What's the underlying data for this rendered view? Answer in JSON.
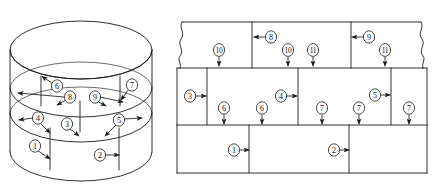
{
  "figure": {
    "type": "technical-line-drawing",
    "background_color": "#ffffff",
    "line_color": "#1a1a1a",
    "views": [
      {
        "id": "cylinder-view",
        "name": "perspective-cylinder-view",
        "callouts": [
          {
            "id": "c1",
            "label": "1",
            "cx": 35,
            "cy": 146,
            "arrow_to": [
              50,
              159
            ],
            "band": "lower"
          },
          {
            "id": "c2",
            "label": "2",
            "cx": 100,
            "cy": 155,
            "arrow_to": [
              119,
              155
            ],
            "band": "lower"
          },
          {
            "id": "c3",
            "label": "3",
            "cx": 67,
            "cy": 124,
            "arrow_to": [
              80,
              136
            ],
            "band": "middle"
          },
          {
            "id": "c4",
            "label": "4",
            "cx": 38,
            "cy": 119,
            "arrow_to": [
              18,
              120
            ],
            "band": "middle"
          },
          {
            "id": "c5",
            "label": "5",
            "cx": 119,
            "cy": 121,
            "arrow_to": [
              142,
              119
            ],
            "band": "middle"
          },
          {
            "id": "c6",
            "label": "6",
            "cx": 56,
            "cy": 86,
            "arrow_to": [
              41,
              76
            ],
            "band": "upper"
          },
          {
            "id": "c7",
            "label": "7",
            "cx": 131,
            "cy": 85,
            "arrow_to": [
              120,
              101
            ],
            "band": "upper"
          },
          {
            "id": "c8",
            "label": "8",
            "cx": 69,
            "cy": 97,
            "arrow_to": [
              17,
              93
            ],
            "band": "upper"
          },
          {
            "id": "c9",
            "label": "9",
            "cx": 95,
            "cy": 97,
            "arrow_to": [
              124,
              103
            ],
            "band": "upper"
          }
        ]
      },
      {
        "id": "developed-view",
        "name": "unrolled-developed-surface-view",
        "callouts": [
          {
            "id": "d1",
            "label": "1",
            "cx": 234,
            "cy": 150,
            "arrow_to": [
              249,
              150
            ],
            "row": "bottom"
          },
          {
            "id": "d2",
            "label": "2",
            "cx": 334,
            "cy": 150,
            "arrow_to": [
              349,
              150
            ],
            "row": "bottom"
          },
          {
            "id": "d3",
            "label": "3",
            "cx": 190,
            "cy": 96,
            "arrow_to": [
              207,
              96
            ],
            "row": "middle"
          },
          {
            "id": "d4",
            "label": "4",
            "cx": 281,
            "cy": 96,
            "arrow_to": [
              298,
              96
            ],
            "row": "middle"
          },
          {
            "id": "d5",
            "label": "5",
            "cx": 375,
            "cy": 95,
            "arrow_to": [
              391,
              95
            ],
            "row": "middle"
          },
          {
            "id": "d6a",
            "label": "6",
            "cx": 224,
            "cy": 108,
            "arrow_to": [
              224,
              125
            ],
            "row": "middle"
          },
          {
            "id": "d6b",
            "label": "6",
            "cx": 262,
            "cy": 108,
            "arrow_to": [
              262,
              125
            ],
            "row": "middle"
          },
          {
            "id": "d7a",
            "label": "7",
            "cx": 322,
            "cy": 108,
            "arrow_to": [
              322,
              125
            ],
            "row": "middle"
          },
          {
            "id": "d7b",
            "label": "7",
            "cx": 359,
            "cy": 108,
            "arrow_to": [
              359,
              125
            ],
            "row": "middle"
          },
          {
            "id": "d7c",
            "label": "7",
            "cx": 409,
            "cy": 108,
            "arrow_to": [
              409,
              125
            ],
            "row": "middle"
          },
          {
            "id": "d8",
            "label": "8",
            "cx": 271,
            "cy": 37,
            "arrow_to": [
              254,
              37
            ],
            "row": "top"
          },
          {
            "id": "d9",
            "label": "9",
            "cx": 369,
            "cy": 37,
            "arrow_to": [
              352,
              37
            ],
            "row": "top"
          },
          {
            "id": "d10a",
            "label": "10",
            "cx": 219,
            "cy": 50,
            "arrow_to": [
              219,
              66
            ],
            "row": "top"
          },
          {
            "id": "d10b",
            "label": "10",
            "cx": 288,
            "cy": 50,
            "arrow_to": [
              288,
              66
            ],
            "row": "top"
          },
          {
            "id": "d11a",
            "label": "11",
            "cx": 313,
            "cy": 50,
            "arrow_to": [
              313,
              66
            ],
            "row": "top"
          },
          {
            "id": "d11b",
            "label": "11",
            "cx": 385,
            "cy": 50,
            "arrow_to": [
              385,
              66
            ],
            "row": "top"
          }
        ]
      }
    ]
  }
}
